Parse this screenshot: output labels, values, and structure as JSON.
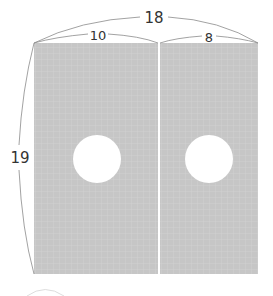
{
  "diagram": {
    "type": "dimensioned rectangle with two circular holes",
    "labels": {
      "total_width": "18",
      "left_width": "10",
      "right_width": "8",
      "height": "19"
    },
    "panels": [
      {
        "name": "left panel",
        "has_hole": true
      },
      {
        "name": "right panel",
        "has_hole": true
      }
    ],
    "colors": {
      "fill": "#c4c4c4",
      "grid": "#dcdcdc",
      "hole": "#ffffff",
      "line": "#8a8a8a"
    }
  }
}
